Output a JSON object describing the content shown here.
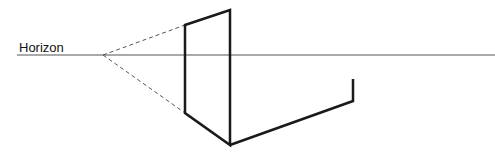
{
  "diagram": {
    "horizon_label": "Horizon",
    "colors": {
      "line": "#1a1a1a",
      "horizon": "#555555",
      "dashed": "#555555"
    },
    "horizon_line": {
      "x1": 17,
      "y1": 55,
      "x2": 495,
      "y2": 55
    },
    "vanishing_point": {
      "x": 103,
      "y": 55
    },
    "dashed_lines": [
      {
        "x1": 103,
        "y1": 55,
        "x2": 185,
        "y2": 25
      },
      {
        "x1": 103,
        "y1": 55,
        "x2": 185,
        "y2": 113
      }
    ],
    "solid_path": "M185,25 L230,10 L230,145 L185,113 Z M230,145 L353,101 L353,79"
  }
}
